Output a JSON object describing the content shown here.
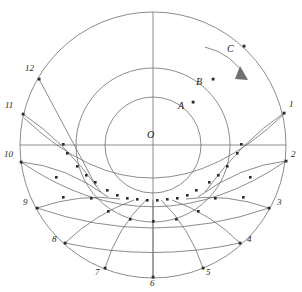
{
  "figure": {
    "title": "",
    "type": "geometric-diagram",
    "background_color": "#ffffff",
    "stroke_color": "#6f6f6f",
    "point_color": "#2b2b2b",
    "label_color": "#1b1b1b",
    "center_label": "O",
    "center": {
      "x": 153,
      "y": 145
    },
    "outer_radius": 133,
    "circles": [
      {
        "name": "outer-circle",
        "radius": 133
      },
      {
        "name": "middle-circle",
        "radius": 77
      },
      {
        "name": "inner-circle",
        "radius": 48
      }
    ],
    "axes": [
      {
        "name": "vertical-axis",
        "x1": 153,
        "y1": 12,
        "x2": 153,
        "y2": 278
      },
      {
        "name": "horizontal-axis",
        "x1": 20,
        "y1": 145,
        "x2": 286,
        "y2": 145
      }
    ],
    "rim_points": [
      {
        "label": "1",
        "x": 284,
        "y": 113,
        "label_x": 289,
        "label_y": 104
      },
      {
        "label": "2",
        "x": 286,
        "y": 161,
        "label_x": 291,
        "label_y": 154
      },
      {
        "label": "3",
        "x": 269,
        "y": 208,
        "label_x": 276,
        "label_y": 201
      },
      {
        "label": "4",
        "x": 240,
        "y": 243,
        "label_x": 247,
        "label_y": 238
      },
      {
        "label": "5",
        "x": 203,
        "y": 268,
        "label_x": 206,
        "label_y": 268
      },
      {
        "label": "6",
        "x": 153,
        "y": 277,
        "label_x": 150,
        "label_y": 280
      },
      {
        "label": "7",
        "x": 105,
        "y": 268,
        "label_x": 97,
        "label_y": 268
      },
      {
        "label": "8",
        "x": 65,
        "y": 243,
        "label_x": 54,
        "label_y": 238
      },
      {
        "label": "9",
        "x": 37,
        "y": 208,
        "label_x": 25,
        "label_y": 201
      },
      {
        "label": "10",
        "x": 21,
        "y": 162,
        "label_x": 6,
        "label_y": 154
      },
      {
        "label": "11",
        "x": 23,
        "y": 114,
        "label_x": 7,
        "label_y": 105
      },
      {
        "label": "12",
        "x": 39,
        "y": 79,
        "label_x": 27,
        "label_y": 67
      }
    ],
    "marked_points": [
      {
        "label": "A",
        "x": 193,
        "y": 102,
        "label_x": 178,
        "label_y": 104
      },
      {
        "label": "B",
        "x": 213,
        "y": 79,
        "label_x": 197,
        "label_y": 81
      },
      {
        "label": "C",
        "x": 244,
        "y": 46,
        "label_x": 228,
        "label_y": 48
      }
    ],
    "arrow": {
      "name": "rotation-direction-arrow",
      "description": "curved arrow indicating clockwise rotation",
      "path": "M 205 47 Q 233 54 246 78",
      "head": "M 240 68 L 247 80 L 236 80 Z"
    },
    "mesh": {
      "description": "radial generator curves from each rim point converging below centre, crossed by concentric trajectory arcs; intersections marked with square dots",
      "convergence_point": {
        "x": 153,
        "y": 196
      },
      "radial_count": 12,
      "arc_count": 4
    }
  }
}
